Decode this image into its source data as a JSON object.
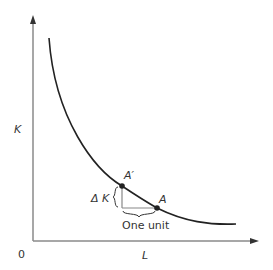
{
  "diagram": {
    "type": "isoquant",
    "axes": {
      "origin_label": "0",
      "y_label": "K",
      "x_label": "L"
    },
    "points": [
      {
        "label": "A′",
        "x": 122,
        "y": 186
      },
      {
        "label": "A",
        "x": 157,
        "y": 208
      }
    ],
    "annotations": {
      "delta_k": "Δ K",
      "one_unit": "One unit"
    },
    "colors": {
      "axis": "#888888",
      "curve": "#222222",
      "triangle": "#888888"
    }
  }
}
